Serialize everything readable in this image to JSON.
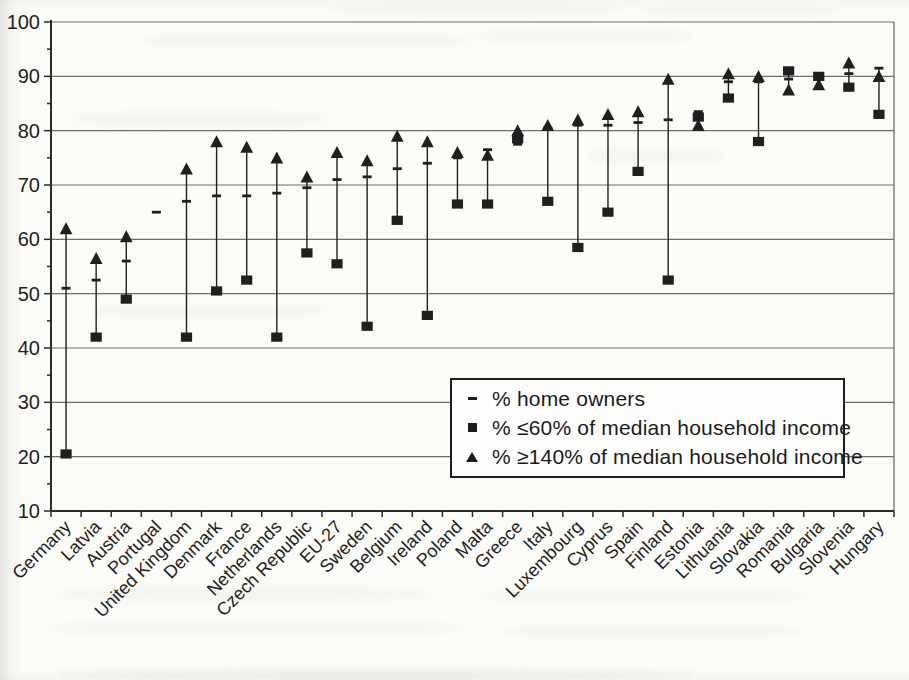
{
  "figure": {
    "background_color": "#fbfbf8",
    "ink_color": "#1f1f1f",
    "grid_color": "#6e6e6e"
  },
  "legend": {
    "items": [
      {
        "marker": "dash",
        "label": "% home owners"
      },
      {
        "marker": "square",
        "label": "% ≤60% of median household income"
      },
      {
        "marker": "triangle",
        "label": "% ≥140% of median household income"
      }
    ]
  },
  "chart_data": {
    "type": "scatter",
    "title": "",
    "xlabel": "",
    "ylabel": "",
    "ylim": [
      10,
      100
    ],
    "yticks": [
      10,
      20,
      30,
      40,
      50,
      60,
      70,
      80,
      90,
      100
    ],
    "grid": "horizontal",
    "plot_border": "left, bottom, top gridline and right border visible",
    "legend_position": "inside lower-right box",
    "marker_note": "vertical line connects the three markers for each country",
    "categories": [
      "Germany",
      "Latvia",
      "Austria",
      "Portugal",
      "United Kingdom",
      "Denmark",
      "France",
      "Netherlands",
      "Czech Republic",
      "EU-27",
      "Sweden",
      "Belgium",
      "Ireland",
      "Poland",
      "Malta",
      "Greece",
      "Italy",
      "Luxembourg",
      "Cyprus",
      "Spain",
      "Finland",
      "Estonia",
      "Lithuania",
      "Slovakia",
      "Romania",
      "Bulgaria",
      "Slovenia",
      "Hungary"
    ],
    "series": [
      {
        "name": "% home owners",
        "marker": "dash",
        "values": [
          51,
          52.5,
          56,
          65,
          67,
          68,
          68,
          68.5,
          69.5,
          71,
          71.5,
          73,
          74,
          75,
          76.5,
          77.5,
          80.5,
          81,
          81,
          81.5,
          82,
          83.5,
          89,
          89,
          89.5,
          89.5,
          90.5,
          91.5
        ]
      },
      {
        "name": "% ≤60% of median household income",
        "marker": "square",
        "values": [
          20.5,
          42,
          49,
          null,
          42,
          50.5,
          52.5,
          42,
          57.5,
          55.5,
          44,
          63.5,
          46,
          66.5,
          66.5,
          78.5,
          67,
          58.5,
          65,
          72.5,
          52.5,
          82.5,
          86,
          78,
          91,
          90,
          88,
          83
        ]
      },
      {
        "name": "% ≥140% of median household income",
        "marker": "triangle",
        "values": [
          62,
          56.5,
          60.5,
          null,
          73,
          78,
          77,
          75,
          71.5,
          76,
          74.5,
          79,
          78,
          76,
          75.5,
          80,
          81,
          82,
          83,
          83.5,
          89.5,
          81,
          90.5,
          90,
          87.5,
          88.5,
          92.5,
          90
        ]
      }
    ]
  }
}
